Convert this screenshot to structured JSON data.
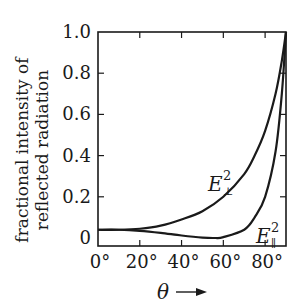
{
  "chart_data": {
    "type": "line",
    "title": "",
    "xlabel": "θ",
    "xlabel_arrow": "→",
    "ylabel_line1": "fractional intensity of",
    "ylabel_line2": "reflected radiation",
    "xlim": [
      0,
      90
    ],
    "ylim": [
      0,
      1.0
    ],
    "x_ticks": [
      0,
      20,
      40,
      60,
      80
    ],
    "x_tick_labels": [
      "0°",
      "20°",
      "40°",
      "60°",
      "80°"
    ],
    "y_ticks": [
      0,
      0.2,
      0.4,
      0.6,
      0.8,
      1.0
    ],
    "y_tick_labels": [
      "0",
      "0.2",
      "0.4",
      "0.6",
      "0.8",
      "1.0"
    ],
    "grid": false,
    "legend": "inline labels on curves",
    "series": [
      {
        "name": "E⊥²",
        "label_main": "E",
        "label_sup": "2",
        "label_sub": "⊥",
        "x": [
          0,
          10,
          20,
          30,
          40,
          50,
          60,
          70,
          75,
          80,
          85,
          88,
          90
        ],
        "y": [
          0.04,
          0.04,
          0.045,
          0.06,
          0.09,
          0.13,
          0.2,
          0.31,
          0.4,
          0.52,
          0.7,
          0.86,
          1.0
        ]
      },
      {
        "name": "E∥²",
        "label_main": "E",
        "label_sup": "2",
        "label_sub": "∥",
        "x": [
          0,
          10,
          20,
          30,
          40,
          50,
          56,
          60,
          70,
          75,
          80,
          85,
          88,
          90
        ],
        "y": [
          0.04,
          0.04,
          0.035,
          0.025,
          0.012,
          0.002,
          0.0,
          0.004,
          0.04,
          0.1,
          0.2,
          0.42,
          0.7,
          1.0
        ]
      }
    ]
  }
}
